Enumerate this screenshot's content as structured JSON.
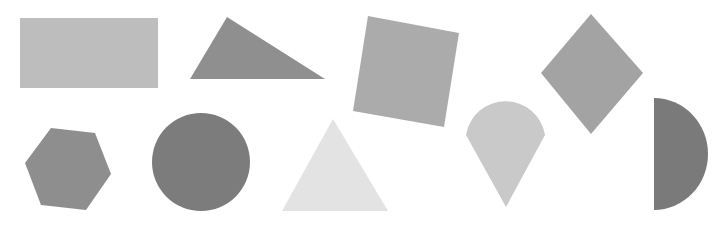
{
  "background": "#ffffff",
  "shapes": [
    {
      "id": "rectangle",
      "label": "Rectangle",
      "color": "#bdbdbd"
    },
    {
      "id": "triangle-scalene",
      "label": "Scalene triangle",
      "color": "#8f8f8f"
    },
    {
      "id": "square",
      "label": "Square (rotated)",
      "color": "#ababab"
    },
    {
      "id": "rhombus",
      "label": "Rhombus",
      "color": "#a3a3a3"
    },
    {
      "id": "hexagon",
      "label": "Hexagon",
      "color": "#8e8e8e"
    },
    {
      "id": "circle",
      "label": "Circle",
      "color": "#7c7c7c"
    },
    {
      "id": "triangle-equilateral",
      "label": "Equilateral triangle",
      "color": "#e3e3e3"
    },
    {
      "id": "teardrop",
      "label": "Teardrop",
      "color": "#c9c9c9"
    },
    {
      "id": "semicircle",
      "label": "Semicircle",
      "color": "#7a7a7a"
    }
  ]
}
